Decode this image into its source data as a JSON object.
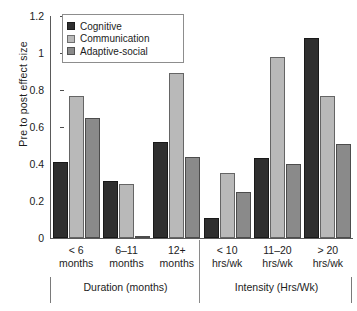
{
  "chart_data": {
    "type": "bar",
    "title": "",
    "xlabel": "",
    "ylabel": "Pre to post effect size",
    "ylim": [
      0,
      1.2
    ],
    "yticks": [
      "0",
      "0.2",
      "0.4",
      "0.6",
      "0.8",
      "1",
      "1.2"
    ],
    "ytick_values": [
      0,
      0.2,
      0.4,
      0.6,
      0.8,
      1,
      1.2
    ],
    "grid": false,
    "legend_position": "top-left",
    "categories": [
      "< 6 months",
      "6–11 months",
      "12+ months",
      "< 10 hrs/wk",
      "11–20 hrs/wk",
      "> 20 hrs/wk"
    ],
    "category_lines": [
      [
        "< 6",
        "months"
      ],
      [
        "6–11",
        "months"
      ],
      [
        "12+",
        "months"
      ],
      [
        "< 10",
        "hrs/wk"
      ],
      [
        "11–20",
        "hrs/wk"
      ],
      [
        "> 20",
        "hrs/wk"
      ]
    ],
    "series": [
      {
        "name": "Cognitive",
        "color": "#2f2f2f",
        "values": [
          0.41,
          0.31,
          0.52,
          0.11,
          0.43,
          1.08
        ]
      },
      {
        "name": "Communication",
        "color": "#b9b9b9",
        "values": [
          0.77,
          0.29,
          0.89,
          0.35,
          0.98,
          0.77
        ]
      },
      {
        "name": "Adaptive-social",
        "color": "#8a8a8a",
        "values": [
          0.65,
          0.01,
          0.44,
          0.25,
          0.4,
          0.51
        ]
      }
    ],
    "group_bands": [
      {
        "label": "Duration (months)",
        "categories": [
          "< 6 months",
          "6–11 months",
          "12+ months"
        ]
      },
      {
        "label": "Intensity (Hrs/Wk)",
        "categories": [
          "< 10 hrs/wk",
          "11–20 hrs/wk",
          "> 20 hrs/wk"
        ]
      }
    ]
  },
  "legend": {
    "items": [
      {
        "label": "Cognitive"
      },
      {
        "label": "Communication"
      },
      {
        "label": "Adaptive-social"
      }
    ]
  }
}
